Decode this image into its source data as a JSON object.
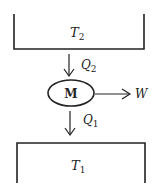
{
  "diagram": {
    "type": "heat-engine",
    "hot_reservoir": {
      "label": "T",
      "subscript": "2"
    },
    "cold_reservoir": {
      "label": "T",
      "subscript": "1"
    },
    "heat_in": {
      "label": "Q",
      "subscript": "2"
    },
    "heat_out": {
      "label": "Q",
      "subscript": "1"
    },
    "engine": {
      "label": "M"
    },
    "work": {
      "label": "W"
    },
    "colors": {
      "stroke": "#222222",
      "background": "#ffffff"
    }
  }
}
